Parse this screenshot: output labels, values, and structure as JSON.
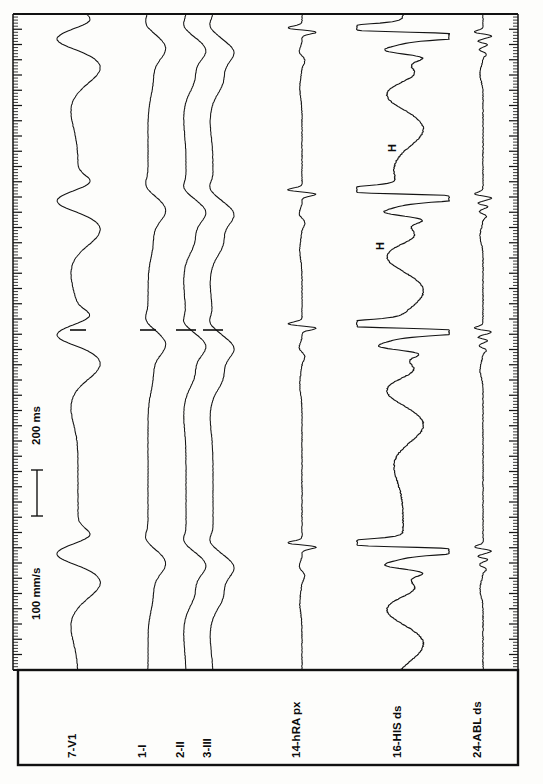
{
  "document": {
    "type": "intracardiac-electrophysiology-recording",
    "orientation": "rotated-90-ccw",
    "background_color": "#fdfdfb",
    "trace_color": "#141414",
    "border_color": "#111111"
  },
  "calibration": {
    "time_label": "200 ms",
    "speed_label": "100 mm/s",
    "bar_present": true
  },
  "annotations": [
    {
      "label": "H",
      "channel": "16-HIS ds",
      "x": 396,
      "y": 148
    },
    {
      "label": "H",
      "channel": "16-HIS ds",
      "x": 384,
      "y": 246
    }
  ],
  "channels": [
    {
      "id": "ch1",
      "label": "7-V1",
      "baseline_x": 78,
      "label_x": 76,
      "kind": "surface-ecg"
    },
    {
      "id": "ch2",
      "label": "1-I",
      "baseline_x": 148,
      "label_x": 146,
      "kind": "surface-ecg"
    },
    {
      "id": "ch3",
      "label": "2-II",
      "baseline_x": 186,
      "label_x": 184,
      "kind": "surface-ecg"
    },
    {
      "id": "ch4",
      "label": "3-III",
      "baseline_x": 213,
      "label_x": 211,
      "kind": "surface-ecg"
    },
    {
      "id": "ch5",
      "label": "14-hRA px",
      "baseline_x": 302,
      "label_x": 300,
      "kind": "intracardiac"
    },
    {
      "id": "ch6",
      "label": "16-HIS ds",
      "baseline_x": 403,
      "label_x": 401,
      "kind": "intracardiac"
    },
    {
      "id": "ch7",
      "label": "24-ABL ds",
      "baseline_x": 483,
      "label_x": 481,
      "kind": "intracardiac"
    }
  ],
  "frame": {
    "trace_area": {
      "x": 13,
      "y": 14,
      "width": 505,
      "height": 656
    },
    "label_area": {
      "x": 18,
      "y": 670,
      "width": 500,
      "height": 95
    }
  },
  "rulers": {
    "left": {
      "x": 13,
      "minor_step": 3.05,
      "major_every": 5,
      "minor_len": 5,
      "major_len": 9
    },
    "right": {
      "x": 518,
      "minor_step": 3.05,
      "major_every": 5,
      "minor_len": 5,
      "major_len": 9
    }
  },
  "beat_markers": {
    "note": "short horizontal tick marks crossing surface ECG traces",
    "rows": [
      329,
      330
    ]
  },
  "chart_data": {
    "type": "line",
    "title": "",
    "xlabel": "",
    "ylabel": "",
    "grid": false,
    "legend": "none",
    "orientation": "vertical-time-axis",
    "time_axis": {
      "direction": "top-to-bottom",
      "span_px": 656,
      "scale": "100 mm/s",
      "reference_interval": "200 ms"
    },
    "series": [
      {
        "name": "7-V1",
        "baseline_px": 78,
        "amplitude_px": 46,
        "morphology": "broad rSR / wide QRS with deep deflections"
      },
      {
        "name": "1-I",
        "baseline_px": 148,
        "amplitude_px": 30,
        "morphology": "wide QRS, monophasic deflection"
      },
      {
        "name": "2-II",
        "baseline_px": 186,
        "amplitude_px": 32,
        "morphology": "wide QRS, notched"
      },
      {
        "name": "3-III",
        "baseline_px": 213,
        "amplitude_px": 34,
        "morphology": "wide QRS, notched"
      },
      {
        "name": "14-hRA px",
        "baseline_px": 302,
        "amplitude_px": 26,
        "morphology": "sharp discrete atrial electrograms"
      },
      {
        "name": "16-HIS ds",
        "baseline_px": 403,
        "amplitude_px": 52,
        "morphology": "saturated clipped ventricular electrograms with His deflections"
      },
      {
        "name": "24-ABL ds",
        "baseline_px": 483,
        "amplitude_px": 22,
        "morphology": "low-amplitude fractionated ablation-catheter electrograms"
      }
    ],
    "beats": [
      {
        "index": 1,
        "time_px": 34
      },
      {
        "index": 2,
        "time_px": 196
      },
      {
        "index": 3,
        "time_px": 330
      },
      {
        "index": 4,
        "time_px": 549
      }
    ]
  }
}
